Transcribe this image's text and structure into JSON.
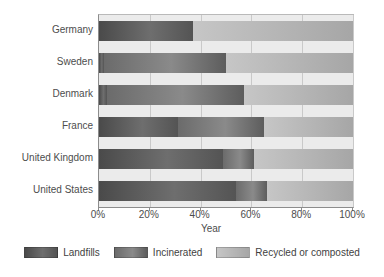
{
  "chart_data": {
    "type": "bar",
    "orientation": "horizontal",
    "stacked": true,
    "normalized_percent": true,
    "title": "",
    "xlabel": "Year",
    "ylabel": "",
    "xlim": [
      0,
      100
    ],
    "grid": true,
    "legend_position": "bottom",
    "xticks": [
      "0%",
      "20%",
      "40%",
      "60%",
      "80%",
      "100%"
    ],
    "xtick_values": [
      0,
      20,
      40,
      60,
      80,
      100
    ],
    "categories": [
      "Germany",
      "Sweden",
      "Denmark",
      "France",
      "United Kingdom",
      "United States"
    ],
    "series": [
      {
        "name": "Landfills",
        "color": "#5a5a5a",
        "values": [
          37,
          2,
          3,
          31,
          49,
          54
        ]
      },
      {
        "name": "Incinerated",
        "color": "#7c7c7c",
        "values": [
          0,
          48,
          54,
          34,
          12,
          12
        ]
      },
      {
        "name": "Recycled or composted",
        "color": "#b8b8b8",
        "values": [
          63,
          50,
          43,
          35,
          39,
          34
        ]
      }
    ]
  },
  "legend": {
    "items": [
      {
        "label": "Landfills"
      },
      {
        "label": "Incinerated"
      },
      {
        "label": "Recycled or composted"
      }
    ]
  },
  "axis": {
    "x_title": "Year"
  }
}
